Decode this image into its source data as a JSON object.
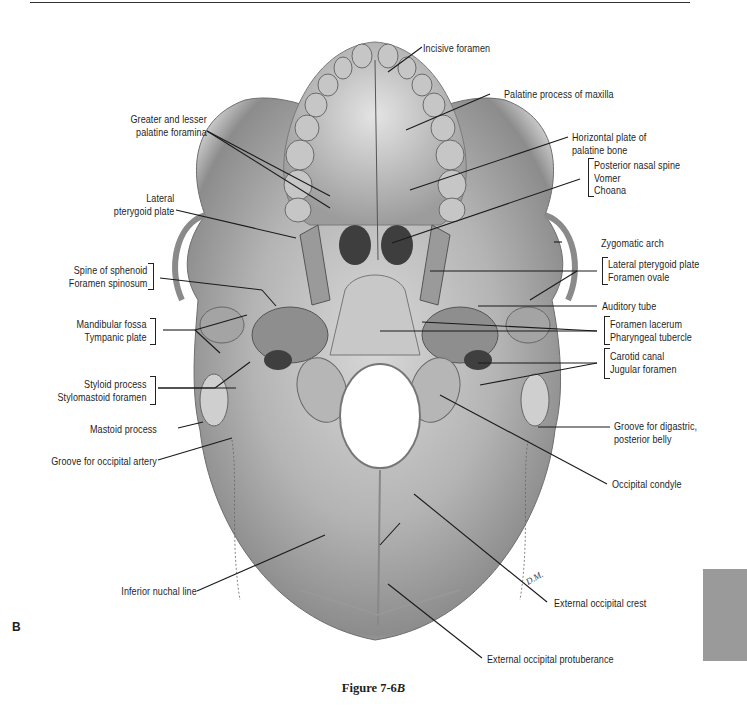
{
  "figure": {
    "panel_letter": "B",
    "caption_prefix": "Figure 7-6",
    "caption_italic": "B",
    "tab_color": "#9a9a9a"
  },
  "labels_left": {
    "greater_lesser_palatine": [
      "Greater and lesser",
      "palatine foramina"
    ],
    "lateral_pterygoid": [
      "Lateral",
      "pterygoid plate"
    ],
    "spine_sphenoid": [
      "Spine of sphenoid",
      "Foramen spinosum"
    ],
    "mandibular_fossa": [
      "Mandibular fossa",
      "Tympanic plate"
    ],
    "styloid": [
      "Styloid process",
      "Stylomastoid  foramen"
    ],
    "mastoid": "Mastoid process",
    "groove_occipital_artery": "Groove for occipital artery",
    "inferior_nuchal_line": "Inferior nuchal line"
  },
  "labels_right": {
    "incisive_foramen": "Incisive foramen",
    "palatine_process": "Palatine process of maxilla",
    "horizontal_plate": [
      "Horizontal plate of",
      "palatine bone"
    ],
    "nasal_group": [
      "Posterior nasal spine",
      "Vomer",
      "Choana"
    ],
    "zygomatic_arch": "Zygomatic arch",
    "pterygoid_group": [
      "Lateral pterygoid plate",
      "Foramen ovale"
    ],
    "auditory_tube": "Auditory tube",
    "lacerum_group": [
      "Foramen lacerum",
      "Pharyngeal tubercle"
    ],
    "carotid_group": [
      "Carotid canal",
      "Jugular foramen"
    ],
    "groove_digastric": [
      "Groove for digastric,",
      "posterior belly"
    ],
    "occipital_condyle": "Occipital condyle",
    "external_occipital_crest": "External occipital crest",
    "external_occipital_protuberance": "External occipital protuberance"
  },
  "artist_initials": "D.M."
}
